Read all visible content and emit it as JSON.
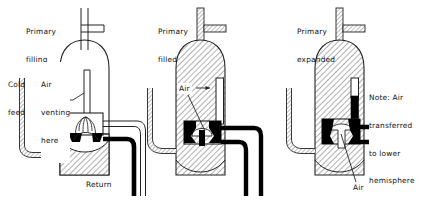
{
  "figure": {
    "type": "engineering-diagram",
    "background_color": "#ffffff",
    "line_color": "#111111",
    "hatch_color": "#6b6b6b",
    "pipe_fill_black": "#000000"
  },
  "panels": [
    {
      "id": "panel-1",
      "title": "Primary\nfilling",
      "title_line1": "Primary",
      "title_line2": "filling",
      "labels": [
        {
          "name": "cold-feed",
          "text": "Cold\nfeed",
          "line1": "Cold",
          "line2": "feed"
        },
        {
          "name": "air-venting-here",
          "text": "Air\nventing\nhere",
          "line1": "Air",
          "line2": "venting",
          "line3": "here"
        },
        {
          "name": "return",
          "text": "Return"
        }
      ],
      "vessel_state": "partially filled at base, dome-shaped liquid surface"
    },
    {
      "id": "panel-2",
      "title": "Primary\nfilled",
      "title_line1": "Primary",
      "title_line2": "filled",
      "labels": [
        {
          "name": "air",
          "text": "Air"
        }
      ],
      "vessel_state": "fully filled, air pocket at top of standpipe"
    },
    {
      "id": "panel-3",
      "title": "Primary\nexpanded",
      "title_line1": "Primary",
      "title_line2": "expanded",
      "labels": [
        {
          "name": "note-air-transferred",
          "text": "Note: Air\ntransferred\nto lower\nhemisphere",
          "line1": "Note: Air",
          "line2": "transferred",
          "line3": "to lower",
          "line4": "hemisphere"
        },
        {
          "name": "air",
          "text": "Air"
        }
      ],
      "vessel_state": "fully filled, air transferred into lower hemisphere of valve body"
    }
  ]
}
